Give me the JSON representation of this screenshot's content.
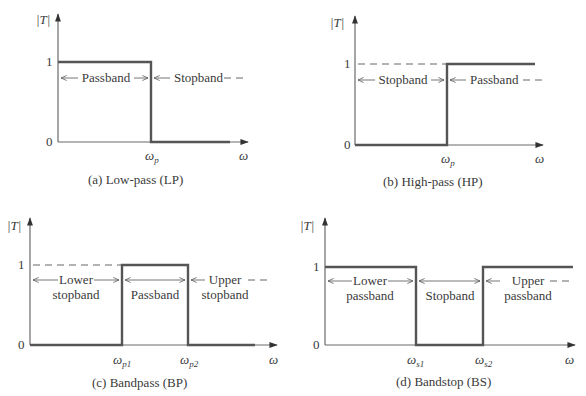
{
  "panels": [
    {
      "id": "a",
      "caption": "(a) Low-pass (LP)",
      "y_label": "|T|",
      "x_label": "ω",
      "y_ticks": [
        "1",
        "0"
      ],
      "x_ticks": [
        {
          "main": "ω",
          "sub": "p"
        }
      ],
      "bands": [
        "Passband",
        "Stopband"
      ]
    },
    {
      "id": "b",
      "caption": "(b) High-pass (HP)",
      "y_label": "|T|",
      "x_label": "ω",
      "y_ticks": [
        "1",
        "0"
      ],
      "x_ticks": [
        {
          "main": "ω",
          "sub": "p"
        }
      ],
      "bands": [
        "Stopband",
        "Passband"
      ]
    },
    {
      "id": "c",
      "caption": "(c) Bandpass (BP)",
      "y_label": "|T|",
      "x_label": "ω",
      "y_ticks": [
        "1",
        "0"
      ],
      "x_ticks": [
        {
          "main": "ω",
          "sub": "p1"
        },
        {
          "main": "ω",
          "sub": "p2"
        }
      ],
      "bands": [
        {
          "line1": "Lower",
          "line2": "stopband"
        },
        {
          "line1": "Passband",
          "line2": ""
        },
        {
          "line1": "Upper",
          "line2": "stopband"
        }
      ]
    },
    {
      "id": "d",
      "caption": "(d) Bandstop (BS)",
      "y_label": "|T|",
      "x_label": "ω",
      "y_ticks": [
        "1",
        "0"
      ],
      "x_ticks": [
        {
          "main": "ω",
          "sub": "s1"
        },
        {
          "main": "ω",
          "sub": "s2"
        }
      ],
      "bands": [
        {
          "line1": "Lower",
          "line2": "passband"
        },
        {
          "line1": "Stopband",
          "line2": ""
        },
        {
          "line1": "Upper",
          "line2": "passband"
        }
      ]
    }
  ]
}
